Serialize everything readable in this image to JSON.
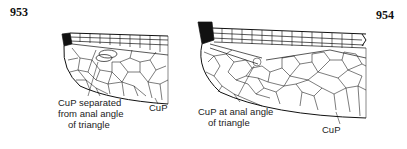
{
  "figures": [
    {
      "number": "953",
      "callout_label_lines": [
        "CuP separated",
        "from anal angle",
        "of triangle"
      ],
      "vein_label": "CuP"
    },
    {
      "number": "954",
      "callout_label_lines": [
        "CuP at anal angle",
        "of triangle"
      ],
      "vein_label": "CuP"
    }
  ],
  "colors": {
    "ink": "#111111",
    "background": "#ffffff"
  }
}
